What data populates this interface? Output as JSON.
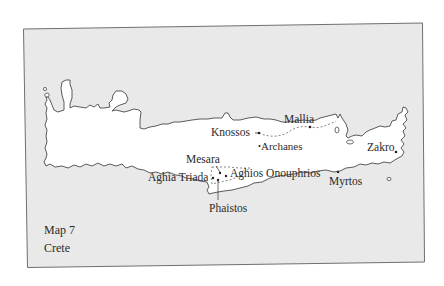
{
  "map": {
    "caption": {
      "number": "Map 7",
      "title": "Crete"
    },
    "colors": {
      "sea": "#e9e9e9",
      "land": "#ffffff",
      "outline": "#4a4a4a",
      "frame": "#6f6f6f",
      "text": "#2a2a2a"
    },
    "sites": [
      {
        "name": "Knossos"
      },
      {
        "name": "Mallia"
      },
      {
        "name": "Archanes"
      },
      {
        "name": "Mesara"
      },
      {
        "name": "Aghia Triada"
      },
      {
        "name": "Aghios Onouphrios"
      },
      {
        "name": "Phaistos"
      },
      {
        "name": "Myrtos"
      },
      {
        "name": "Zakro"
      }
    ]
  }
}
